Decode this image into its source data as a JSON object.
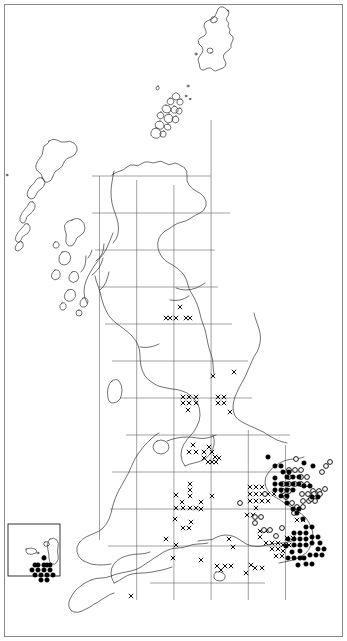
{
  "figure": {
    "kind": "distribution-map",
    "region": "British Isles",
    "title": "",
    "background_color": "#ffffff",
    "border_color": "#8a8a8a",
    "coast_color": "#1a1a1a",
    "grid_color": "#555555"
  },
  "chart_data": {
    "type": "scatter",
    "title": "",
    "subtitle": "",
    "xlabel": "",
    "ylabel": "",
    "grid": true,
    "legend_position": "none",
    "projection": "British National Grid (100 km squares)",
    "xlim": [
      0,
      347
    ],
    "ylim": [
      0,
      641
    ],
    "grid_spacing_px": 37.2,
    "grid_origin_px": [
      99.5,
      540.0
    ],
    "legend_entries": [
      {
        "symbol": "cross",
        "glyph": "×",
        "label": "pre-1970 record"
      },
      {
        "symbol": "open-circle",
        "glyph": "○",
        "label": "1970–1986 record"
      },
      {
        "symbol": "filled-circle",
        "glyph": "●",
        "label": "1987 onwards record"
      }
    ],
    "series": [
      {
        "name": "cross",
        "marker": "x",
        "count": 96,
        "points": [
          [
            180,
            307
          ],
          [
            170,
            318
          ],
          [
            176,
            318
          ],
          [
            190,
            318
          ],
          [
            213,
            376
          ],
          [
            234,
            372
          ],
          [
            183,
            397
          ],
          [
            189,
            397
          ],
          [
            196,
            397
          ],
          [
            183,
            403
          ],
          [
            189,
            403
          ],
          [
            196,
            403
          ],
          [
            188,
            410
          ],
          [
            218,
            397
          ],
          [
            224,
            397
          ],
          [
            218,
            403
          ],
          [
            224,
            403
          ],
          [
            230,
            412
          ],
          [
            193,
            445
          ],
          [
            189,
            452
          ],
          [
            196,
            452
          ],
          [
            204,
            452
          ],
          [
            209,
            447
          ],
          [
            212,
            452
          ],
          [
            215,
            457
          ],
          [
            204,
            458
          ],
          [
            208,
            462
          ],
          [
            212,
            462
          ],
          [
            216,
            462
          ],
          [
            219,
            458
          ],
          [
            190,
            484
          ],
          [
            190,
            490
          ],
          [
            190,
            496
          ],
          [
            176,
            495
          ],
          [
            182,
            502
          ],
          [
            176,
            508
          ],
          [
            183,
            508
          ],
          [
            190,
            508
          ],
          [
            196,
            508
          ],
          [
            201,
            502
          ],
          [
            201,
            509
          ],
          [
            212,
            496
          ],
          [
            250,
            487
          ],
          [
            256,
            487
          ],
          [
            262,
            487
          ],
          [
            250,
            494
          ],
          [
            256,
            494
          ],
          [
            262,
            494
          ],
          [
            250,
            501
          ],
          [
            256,
            501
          ],
          [
            262,
            501
          ],
          [
            256,
            508
          ],
          [
            268,
            494
          ],
          [
            274,
            494
          ],
          [
            268,
            501
          ],
          [
            247,
            515
          ],
          [
            253,
            515
          ],
          [
            191,
            522
          ],
          [
            175,
            519
          ],
          [
            183,
            528
          ],
          [
            189,
            528
          ],
          [
            166,
            539
          ],
          [
            176,
            545
          ],
          [
            229,
            539
          ],
          [
            233,
            547
          ],
          [
            173,
            558
          ],
          [
            201,
            560
          ],
          [
            217,
            566
          ],
          [
            221,
            570
          ],
          [
            225,
            566
          ],
          [
            231,
            566
          ],
          [
            251,
            565
          ],
          [
            260,
            531
          ],
          [
            266,
            531
          ],
          [
            260,
            537
          ],
          [
            266,
            543
          ],
          [
            272,
            543
          ],
          [
            278,
            543
          ],
          [
            272,
            549
          ],
          [
            278,
            549
          ],
          [
            283,
            545
          ],
          [
            289,
            545
          ],
          [
            283,
            551
          ],
          [
            276,
            556
          ],
          [
            282,
            556
          ],
          [
            287,
            538
          ],
          [
            293,
            538
          ],
          [
            131,
            596
          ],
          [
            255,
            568
          ],
          [
            262,
            568
          ],
          [
            297,
            520
          ],
          [
            303,
            520
          ],
          [
            246,
            573
          ],
          [
            186,
            318
          ],
          [
            166,
            318
          ]
        ]
      },
      {
        "name": "open-circle",
        "marker": "o",
        "count": 41,
        "points": [
          [
            296,
            459
          ],
          [
            330,
            462
          ],
          [
            289,
            470
          ],
          [
            295,
            470
          ],
          [
            301,
            470
          ],
          [
            289,
            477
          ],
          [
            301,
            477
          ],
          [
            283,
            484
          ],
          [
            289,
            484
          ],
          [
            295,
            484
          ],
          [
            301,
            484
          ],
          [
            307,
            477
          ],
          [
            307,
            484
          ],
          [
            322,
            472
          ],
          [
            326,
            466
          ],
          [
            313,
            491
          ],
          [
            319,
            491
          ],
          [
            283,
            491
          ],
          [
            289,
            491
          ],
          [
            240,
            503
          ],
          [
            265,
            494
          ],
          [
            302,
            494
          ],
          [
            308,
            494
          ],
          [
            314,
            494
          ],
          [
            320,
            494
          ],
          [
            303,
            501
          ],
          [
            309,
            501
          ],
          [
            315,
            501
          ],
          [
            297,
            507
          ],
          [
            303,
            507
          ],
          [
            255,
            517
          ],
          [
            261,
            517
          ],
          [
            255,
            523
          ],
          [
            264,
            530
          ],
          [
            270,
            530
          ],
          [
            276,
            536
          ],
          [
            282,
            528
          ],
          [
            294,
            513
          ],
          [
            311,
            499
          ],
          [
            286,
            497
          ],
          [
            292,
            503
          ],
          [
            325,
            489
          ]
        ]
      },
      {
        "name": "filled-circle",
        "marker": "●",
        "count": 78,
        "points": [
          [
            275,
            466
          ],
          [
            281,
            466
          ],
          [
            304,
            463
          ],
          [
            313,
            466
          ],
          [
            287,
            477
          ],
          [
            293,
            477
          ],
          [
            299,
            477
          ],
          [
            281,
            484
          ],
          [
            287,
            484
          ],
          [
            293,
            484
          ],
          [
            299,
            484
          ],
          [
            281,
            490
          ],
          [
            287,
            490
          ],
          [
            293,
            490
          ],
          [
            281,
            496
          ],
          [
            287,
            496
          ],
          [
            287,
            503
          ],
          [
            304,
            486
          ],
          [
            310,
            486
          ],
          [
            312,
            497
          ],
          [
            318,
            497
          ],
          [
            297,
            513
          ],
          [
            303,
            519
          ],
          [
            294,
            533
          ],
          [
            300,
            533
          ],
          [
            306,
            533
          ],
          [
            288,
            539
          ],
          [
            294,
            539
          ],
          [
            300,
            539
          ],
          [
            306,
            539
          ],
          [
            294,
            545
          ],
          [
            300,
            545
          ],
          [
            306,
            545
          ],
          [
            300,
            551
          ],
          [
            312,
            537
          ],
          [
            318,
            537
          ],
          [
            312,
            543
          ],
          [
            288,
            558
          ],
          [
            294,
            558
          ],
          [
            300,
            558
          ],
          [
            306,
            564
          ],
          [
            312,
            564
          ],
          [
            318,
            549
          ],
          [
            324,
            549
          ],
          [
            320,
            543
          ],
          [
            268,
            457
          ],
          [
            283,
            472
          ],
          [
            289,
            472
          ],
          [
            275,
            478
          ],
          [
            275,
            484
          ],
          [
            275,
            490
          ],
          [
            293,
            509
          ],
          [
            299,
            509
          ],
          [
            306,
            527
          ],
          [
            312,
            527
          ],
          [
            286,
            546
          ],
          [
            292,
            552
          ],
          [
            298,
            565
          ],
          [
            304,
            558
          ],
          [
            310,
            555
          ],
          [
            316,
            555
          ],
          [
            322,
            555
          ],
          [
            38,
            570
          ],
          [
            44,
            570
          ],
          [
            50,
            570
          ],
          [
            35,
            575
          ],
          [
            41,
            575
          ],
          [
            47,
            575
          ],
          [
            53,
            575
          ],
          [
            38,
            565
          ],
          [
            44,
            565
          ],
          [
            32,
            570
          ],
          [
            47,
            565
          ],
          [
            41,
            580
          ],
          [
            47,
            580
          ],
          [
            35,
            565
          ],
          [
            50,
            565
          ],
          [
            44,
            558
          ]
        ]
      }
    ]
  },
  "inset": {
    "name": "channel-islands-inset",
    "frame_px": [
      8,
      524,
      52,
      52
    ],
    "label": ""
  }
}
